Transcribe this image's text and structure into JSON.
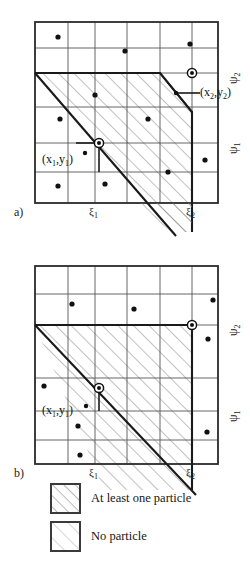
{
  "figure": {
    "kind": "two-panel grid particle diagram",
    "panels": [
      {
        "id": "a",
        "label": "a)",
        "x_ticks": [
          {
            "name": "xi1",
            "text": "ξ",
            "sub": "1",
            "x_px": 95
          },
          {
            "name": "xi2",
            "text": "ξ",
            "sub": "2",
            "x_px": 192
          }
        ],
        "y_ticks": [
          {
            "name": "psi1",
            "text": "ψ",
            "sub": "1",
            "y_px": 143
          },
          {
            "name": "psi2",
            "text": "ψ",
            "sub": "2",
            "y_px": 73
          }
        ],
        "point_labels": [
          {
            "name": "point-x1y1",
            "text": "(x",
            "sub1": "1",
            "mid": ",y",
            "sub2": "1",
            "close": ")"
          },
          {
            "name": "point-x2y2",
            "text": "(x",
            "sub1": "2",
            "mid": ",y",
            "sub2": "2",
            "close": ")"
          }
        ],
        "grid_cols_px": [
          35,
          68,
          95,
          127,
          160,
          192,
          218
        ],
        "grid_rows_px": [
          22,
          48,
          73,
          107,
          143,
          172,
          203
        ],
        "particles_px": [
          [
            58,
            37
          ],
          [
            125,
            51
          ],
          [
            190,
            44
          ],
          [
            95,
            95
          ],
          [
            148,
            119
          ],
          [
            60,
            119
          ],
          [
            205,
            160
          ],
          [
            58,
            186
          ],
          [
            105,
            184
          ],
          [
            168,
            172
          ]
        ],
        "markers_px": [
          {
            "name": "marker-x1y1",
            "x": 99,
            "y": 143
          },
          {
            "name": "marker-x2y2",
            "x": 192,
            "y": 73
          }
        ],
        "stair_px": [
          [
            35,
            73
          ],
          [
            160,
            73
          ],
          [
            192,
            112
          ],
          [
            192,
            203
          ]
        ],
        "diagonal_px": [
          [
            35,
            73
          ],
          [
            172,
            232
          ]
        ]
      },
      {
        "id": "b",
        "label": "b)",
        "x_ticks": [
          {
            "name": "xi1",
            "text": "ξ",
            "sub": "1",
            "x_px": 95
          },
          {
            "name": "xi2",
            "text": "ξ",
            "sub": "2",
            "x_px": 192
          }
        ],
        "y_ticks": [
          {
            "name": "psi1",
            "text": "ψ",
            "sub": "1",
            "y_px": 411
          },
          {
            "name": "psi2",
            "text": "ψ",
            "sub": "2",
            "y_px": 325
          }
        ],
        "point_labels": [
          {
            "name": "point-x1y1",
            "text": "(x",
            "sub1": "1",
            "mid": ",y",
            "sub2": "1",
            "close": ")"
          }
        ],
        "grid_cols_px": [
          35,
          68,
          95,
          127,
          160,
          192,
          218
        ],
        "grid_rows_px": [
          266,
          294,
          325,
          378,
          411,
          440,
          464
        ],
        "particles_px": [
          [
            72,
            304
          ],
          [
            213,
            300
          ],
          [
            134,
            309
          ],
          [
            208,
            339
          ],
          [
            44,
            386
          ],
          [
            79,
            406
          ],
          [
            78,
            426
          ],
          [
            207,
            432
          ],
          [
            80,
            455
          ]
        ],
        "markers_px": [
          {
            "name": "marker-x2y2",
            "x": 192,
            "y": 325
          },
          {
            "name": "marker-x1y1",
            "x": 99,
            "y": 388
          }
        ],
        "stair_px": [
          [
            35,
            325
          ],
          [
            192,
            325
          ],
          [
            192,
            464
          ]
        ],
        "diagonal_px": [
          [
            35,
            325
          ],
          [
            192,
            490
          ]
        ]
      }
    ],
    "legend": {
      "items": [
        {
          "name": "legend-at-least-one-particle",
          "swatch": "hatch-dark",
          "label": "At least one particle"
        },
        {
          "name": "legend-no-particle",
          "swatch": "hatch-light",
          "label": "No particle"
        }
      ]
    },
    "colors": {
      "frame": "#2a2a2a",
      "grid": "#555555",
      "hatch_dark": "#8c8c8c",
      "hatch_light": "#b5b5b5",
      "particle": "#111111",
      "marker": "#111111",
      "background": "#ffffff"
    }
  }
}
